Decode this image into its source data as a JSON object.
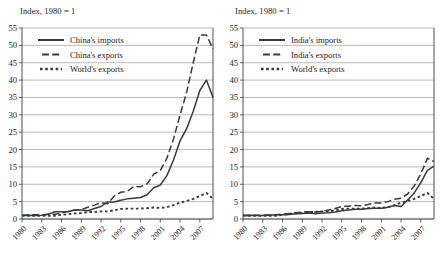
{
  "figure": {
    "panels": [
      {
        "id": "china",
        "title": "Index, 1980 = 1",
        "legend": [
          {
            "label": "China's imports",
            "style": "solid"
          },
          {
            "label": "China's exports",
            "style": "long-dash"
          },
          {
            "label": "World's exports",
            "style": "dotted"
          }
        ]
      },
      {
        "id": "india",
        "title": "Index, 1980 = 1",
        "legend": [
          {
            "label": "India's imports",
            "style": "solid"
          },
          {
            "label": "India's exports",
            "style": "long-dash"
          },
          {
            "label": "World's exports",
            "style": "dotted"
          }
        ]
      }
    ]
  },
  "chart_data": [
    {
      "type": "line",
      "id": "china",
      "title": "Index, 1980 = 1",
      "xlabel": "",
      "ylabel": "Index, 1980 = 1",
      "xlim": [
        1980,
        2009
      ],
      "ylim": [
        0,
        55
      ],
      "ytick_step": 5,
      "yticks": [
        0,
        5,
        10,
        15,
        20,
        25,
        30,
        35,
        40,
        45,
        50,
        55
      ],
      "xticks": [
        1980,
        1983,
        1986,
        1989,
        1992,
        1995,
        1998,
        2001,
        2004,
        2007
      ],
      "grid": "horizontal",
      "legend_position": "top-left",
      "x": [
        1980,
        1981,
        1982,
        1983,
        1984,
        1985,
        1986,
        1987,
        1988,
        1989,
        1990,
        1991,
        1992,
        1993,
        1994,
        1995,
        1996,
        1997,
        1998,
        1999,
        2000,
        2001,
        2002,
        2003,
        2004,
        2005,
        2006,
        2007,
        2008,
        2009
      ],
      "series": [
        {
          "name": "China's imports",
          "style": "solid",
          "color": "#3a3a3a",
          "values": [
            1.0,
            1.1,
            1.0,
            1.1,
            1.4,
            2.1,
            2.1,
            2.1,
            2.6,
            2.6,
            2.4,
            3.0,
            3.6,
            4.9,
            4.9,
            5.4,
            5.8,
            6.0,
            6.2,
            7.0,
            9.0,
            9.8,
            12.5,
            17.0,
            22.5,
            26.0,
            31.0,
            37.0,
            40.0,
            35.0
          ]
        },
        {
          "name": "China's exports",
          "style": "long-dash",
          "color": "#3a3a3a",
          "values": [
            1.0,
            1.2,
            1.2,
            1.2,
            1.4,
            1.4,
            1.7,
            2.2,
            2.6,
            2.7,
            3.4,
            4.0,
            4.7,
            4.4,
            6.6,
            7.7,
            8.0,
            9.4,
            9.3,
            10.1,
            12.9,
            14.0,
            17.5,
            23.0,
            30.0,
            36.5,
            45.0,
            53.0,
            53.0,
            49.0
          ]
        },
        {
          "name": "World's exports",
          "style": "dotted",
          "color": "#3a3a3a",
          "values": [
            1.0,
            0.95,
            0.9,
            0.9,
            0.95,
            0.95,
            1.2,
            1.4,
            1.6,
            1.7,
            2.0,
            2.0,
            2.2,
            2.2,
            2.5,
            2.9,
            3.0,
            3.0,
            3.0,
            3.1,
            3.3,
            3.2,
            3.4,
            4.0,
            4.7,
            5.2,
            5.8,
            6.6,
            7.5,
            5.8
          ]
        }
      ]
    },
    {
      "type": "line",
      "id": "india",
      "title": "Index, 1980 = 1",
      "xlabel": "",
      "ylabel": "Index, 1980 = 1",
      "xlim": [
        1980,
        2009
      ],
      "ylim": [
        0,
        55
      ],
      "ytick_step": 5,
      "yticks": [
        0,
        5,
        10,
        15,
        20,
        25,
        30,
        35,
        40,
        45,
        50,
        55
      ],
      "xticks": [
        1980,
        1983,
        1986,
        1989,
        1992,
        1995,
        1998,
        2001,
        2004,
        2007
      ],
      "grid": "horizontal",
      "legend_position": "top-left",
      "x": [
        1980,
        1981,
        1982,
        1983,
        1984,
        1985,
        1986,
        1987,
        1988,
        1989,
        1990,
        1991,
        1992,
        1993,
        1994,
        1995,
        1996,
        1997,
        1998,
        1999,
        2000,
        2001,
        2002,
        2003,
        2004,
        2005,
        2006,
        2007,
        2008,
        2009
      ],
      "series": [
        {
          "name": "India's imports",
          "style": "solid",
          "color": "#3a3a3a",
          "values": [
            1.0,
            1.05,
            1.0,
            1.0,
            1.1,
            1.2,
            1.2,
            1.3,
            1.5,
            1.6,
            1.7,
            1.5,
            1.7,
            1.8,
            2.0,
            2.4,
            2.6,
            2.8,
            2.8,
            3.0,
            3.1,
            3.1,
            3.4,
            3.9,
            3.6,
            5.5,
            7.5,
            10.5,
            14.0,
            15.2
          ]
        },
        {
          "name": "India's exports",
          "style": "long-dash",
          "color": "#3a3a3a",
          "values": [
            1.0,
            1.0,
            1.1,
            1.1,
            1.2,
            1.2,
            1.4,
            1.6,
            1.8,
            2.0,
            2.1,
            2.0,
            2.2,
            2.6,
            3.0,
            3.6,
            3.7,
            3.9,
            3.8,
            4.2,
            4.6,
            4.6,
            5.0,
            5.7,
            6.0,
            7.2,
            9.5,
            13.0,
            17.5,
            16.5
          ]
        },
        {
          "name": "World's exports",
          "style": "dotted",
          "color": "#3a3a3a",
          "values": [
            1.0,
            0.95,
            0.9,
            0.9,
            0.95,
            0.95,
            1.2,
            1.4,
            1.6,
            1.7,
            2.0,
            2.0,
            2.2,
            2.2,
            2.5,
            2.9,
            3.0,
            3.0,
            3.0,
            3.1,
            3.3,
            3.2,
            3.4,
            4.0,
            4.7,
            5.2,
            5.8,
            6.6,
            7.5,
            5.8
          ]
        }
      ]
    }
  ]
}
